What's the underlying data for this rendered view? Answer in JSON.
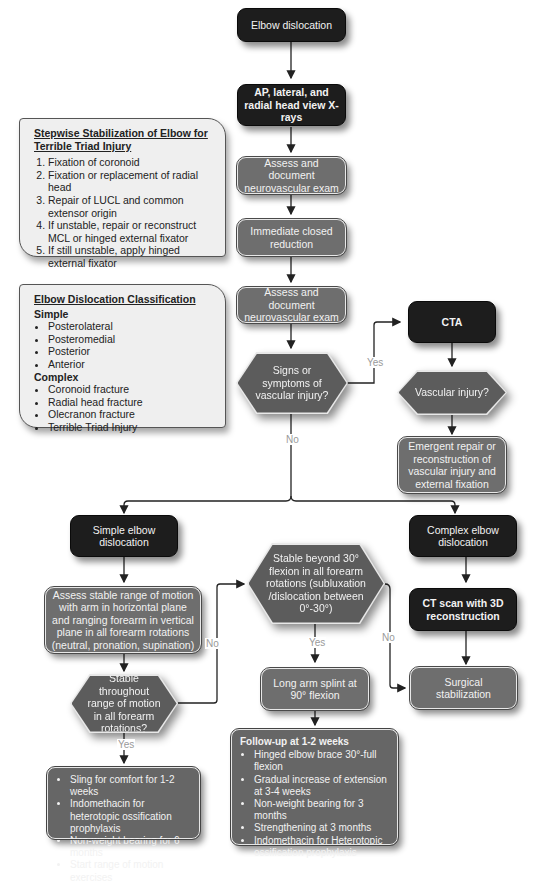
{
  "nodes": {
    "elbow_dislocation": "Elbow dislocation",
    "xrays": "AP, lateral, and radial head view X-rays",
    "assess_nv_1": "Assess and document neurovascular exam",
    "closed_reduction": "Immediate closed reduction",
    "assess_nv_2": "Assess and document neurovascular exam",
    "signs_vascular": "Signs or symptoms of vascular injury?",
    "cta": "CTA",
    "vascular_injury": "Vascular injury?",
    "emergent_repair": "Emergent repair or reconstruction of vascular injury and external fixation",
    "simple_dislocation": "Simple elbow dislocation",
    "complex_dislocation": "Complex elbow dislocation",
    "assess_rom": "Assess stable range of motion with arm in horizontal plane and ranging forearm in vertical plane in all forearm rotations (neutral, pronation, supination)",
    "stable_throughout": "Stable throughout range of motion in all forearm rotations?",
    "stable_beyond_30": "Stable beyond 30° flexion in all forearm rotations (subluxation /dislocation between 0°-30°)",
    "ct_scan": "CT scan with 3D reconstruction",
    "long_arm_splint": "Long arm splint at 90° flexion",
    "surgical_stabilization": "Surgical stabilization"
  },
  "edge_labels": {
    "yes_signs": "Yes",
    "no_signs": "No",
    "no_stable_throughout": "No",
    "yes_stable_throughout": "Yes",
    "yes_stable_beyond": "Yes",
    "no_stable_beyond": "No"
  },
  "stepwise_box": {
    "title": "Stepwise Stabilization of Elbow for Terrible Triad Injury",
    "items": [
      "Fixation of coronoid",
      "Fixation or replacement of radial head",
      "Repair of LUCL and common extensor origin",
      "If unstable, repair or reconstruct MCL or hinged external fixator",
      "If still unstable, apply hinged external fixator"
    ]
  },
  "classification_box": {
    "title": "Elbow Dislocation Classification",
    "simple_label": "Simple",
    "simple_items": [
      "Posterolateral",
      "Posteromedial",
      "Posterior",
      "Anterior"
    ],
    "complex_label": "Complex",
    "complex_items": [
      "Coronoid fracture",
      "Radial head fracture",
      "Olecranon fracture",
      "Terrible Triad Injury"
    ]
  },
  "stable_outcome_box": {
    "items": [
      "Sling for comfort for 1-2 weeks",
      "Indomethacin for heterotopic ossification prophylaxis",
      "Non-weight bearing for 6 months",
      "Start range of motion exercises"
    ]
  },
  "followup_box": {
    "title": "Follow-up at 1-2 weeks",
    "items": [
      "Hinged elbow brace 30°-full flexion",
      "Gradual increase of extension at 3-4 weeks",
      "Non-weight bearing for 3 months",
      "Strengthening at 3 months",
      "Indomethacin for Heterotopic ossification prophylaxis"
    ]
  },
  "colors": {
    "dark_node": "#1d1d1d",
    "grey_node": "#6e6e6e",
    "decision": "#5c5c5c",
    "info_bg": "#efefef",
    "line": "#222222",
    "edge_label": "#9a9a9a"
  }
}
